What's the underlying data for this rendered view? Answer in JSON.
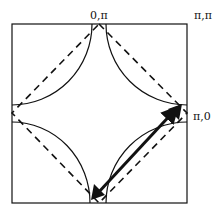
{
  "figure": {
    "labels": {
      "top_center": "0,π",
      "top_right": "π,π",
      "right_middle": "π,0"
    },
    "colors": {
      "line": "#111111",
      "background": "#ffffff"
    },
    "elements": {
      "zone_boundary": "solid square",
      "fermi_surface": "four arcs around zone corners",
      "magnetic_zone_boundary": "dashed diamond",
      "nesting_vector": "double-headed arrow"
    }
  }
}
